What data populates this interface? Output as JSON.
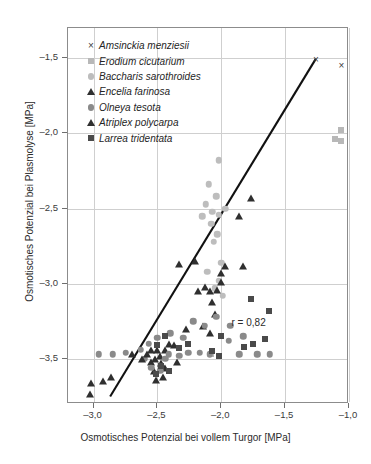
{
  "chart_data": {
    "type": "scatter",
    "title": "",
    "xlabel": "Osmotisches Potenzial bei vollem Turgor [MPa]",
    "ylabel": "Osmotisches Potenzial bei Plasmolyse [MPa]",
    "xlim": [
      -3.2,
      -1.0
    ],
    "ylim": [
      -3.8,
      -1.3
    ],
    "xticks": [
      -3.0,
      -2.5,
      -2.0,
      -1.5,
      -1.0
    ],
    "xticklabels": [
      "–3,0",
      "–2,5",
      "–2,0",
      "–1,5",
      "–1,0"
    ],
    "yticks": [
      -1.5,
      -2.0,
      -2.5,
      -3.0,
      -3.5
    ],
    "yticklabels": [
      "–1,5",
      "–2,0",
      "–2,5",
      "–3,0",
      "–3,5"
    ],
    "grid": true,
    "legend_position": "upper-left-inside",
    "annotation": "r = 0,82",
    "regression_line": {
      "x0": -2.87,
      "y0": -3.75,
      "x1": -1.26,
      "y1": -1.505
    },
    "series": [
      {
        "name": "Amsinckia menziesii",
        "marker": "x",
        "color": "#3d3d3d",
        "points": [
          [
            -1.26,
            -1.51
          ],
          [
            -1.06,
            -1.55
          ]
        ]
      },
      {
        "name": "Erodium cicutarium",
        "marker": "square",
        "color": "#b8b8b8",
        "points": [
          [
            -2.08,
            -3.47
          ],
          [
            -1.06,
            -1.98
          ],
          [
            -1.06,
            -2.05
          ],
          [
            -1.11,
            -2.04
          ]
        ]
      },
      {
        "name": "Baccharis sarothroides",
        "marker": "circle",
        "color": "#bdbdbd",
        "points": [
          [
            -2.02,
            -2.18
          ],
          [
            -2.1,
            -2.34
          ],
          [
            -2.04,
            -2.42
          ],
          [
            -2.12,
            -2.47
          ],
          [
            -2.07,
            -2.52
          ],
          [
            -2.02,
            -2.54
          ],
          [
            -1.97,
            -2.5
          ],
          [
            -2.15,
            -2.55
          ],
          [
            -2.08,
            -2.6
          ],
          [
            -2.03,
            -2.67
          ],
          [
            -2.06,
            -2.72
          ],
          [
            -2.0,
            -2.86
          ],
          [
            -2.11,
            -2.92
          ],
          [
            -2.02,
            -2.98
          ],
          [
            -2.05,
            -3.03
          ],
          [
            -1.99,
            -3.08
          ]
        ]
      },
      {
        "name": "Encelia farinosa",
        "marker": "triangle",
        "color": "#2f2f2f",
        "points": [
          [
            -1.77,
            -2.43
          ],
          [
            -1.86,
            -2.55
          ],
          [
            -1.83,
            -2.88
          ],
          [
            -1.97,
            -2.88
          ],
          [
            -2.0,
            -2.93
          ],
          [
            -2.0,
            -2.99
          ],
          [
            -2.03,
            -3.04
          ],
          [
            -2.09,
            -3.05
          ],
          [
            -2.21,
            -2.85
          ],
          [
            -2.33,
            -2.87
          ],
          [
            -2.13,
            -3.02
          ],
          [
            -2.18,
            -3.05
          ],
          [
            -2.07,
            -3.12
          ],
          [
            -2.05,
            -3.2
          ],
          [
            -2.14,
            -3.28
          ],
          [
            -2.09,
            -3.33
          ],
          [
            -2.28,
            -3.3
          ],
          [
            -2.37,
            -3.41
          ],
          [
            -2.44,
            -3.44
          ],
          [
            -2.48,
            -3.48
          ],
          [
            -2.52,
            -3.5
          ],
          [
            -2.47,
            -3.53
          ],
          [
            -2.44,
            -3.56
          ],
          [
            -2.41,
            -3.4
          ],
          [
            -2.5,
            -3.44
          ],
          [
            -2.55,
            -3.52
          ],
          [
            -2.53,
            -3.58
          ],
          [
            -2.46,
            -3.62
          ],
          [
            -2.51,
            -3.64
          ],
          [
            -2.7,
            -3.47
          ],
          [
            -2.35,
            -3.52
          ]
        ]
      },
      {
        "name": "Olneya tesota",
        "marker": "circle",
        "color": "#8a8a8a",
        "points": [
          [
            -2.04,
            -3.22
          ],
          [
            -1.93,
            -3.28
          ],
          [
            -2.13,
            -3.28
          ],
          [
            -2.22,
            -3.25
          ],
          [
            -1.83,
            -3.35
          ],
          [
            -1.94,
            -3.38
          ],
          [
            -2.3,
            -3.36
          ],
          [
            -2.4,
            -3.33
          ],
          [
            -2.5,
            -3.36
          ],
          [
            -2.57,
            -3.4
          ],
          [
            -2.63,
            -3.44
          ],
          [
            -2.75,
            -3.46
          ],
          [
            -2.85,
            -3.47
          ],
          [
            -2.96,
            -3.47
          ],
          [
            -2.41,
            -3.47
          ],
          [
            -2.33,
            -3.48
          ],
          [
            -2.26,
            -3.46
          ],
          [
            -2.17,
            -3.46
          ],
          [
            -2.09,
            -3.47
          ],
          [
            -1.86,
            -3.47
          ],
          [
            -1.72,
            -3.47
          ],
          [
            -1.62,
            -3.47
          ],
          [
            -2.55,
            -3.56
          ],
          [
            -2.48,
            -3.58
          ],
          [
            -2.6,
            -3.5
          ],
          [
            -2.44,
            -3.5
          ]
        ]
      },
      {
        "name": "Atriplex polycarpa",
        "marker": "triangle",
        "color": "#2f2f2f",
        "points": [
          [
            -3.02,
            -3.66
          ],
          [
            -2.93,
            -3.65
          ],
          [
            -2.86,
            -3.62
          ],
          [
            -3.03,
            -3.73
          ],
          [
            -2.58,
            -3.47
          ],
          [
            -2.55,
            -3.44
          ],
          [
            -2.62,
            -3.5
          ]
        ]
      },
      {
        "name": "Larrea tridentata",
        "marker": "square",
        "color": "#4a4a4a",
        "points": [
          [
            -1.77,
            -3.1
          ],
          [
            -1.63,
            -3.18
          ],
          [
            -1.66,
            -3.37
          ],
          [
            -1.75,
            -3.4
          ],
          [
            -1.82,
            -3.42
          ],
          [
            -2.0,
            -3.35
          ],
          [
            -2.07,
            -3.45
          ],
          [
            -2.02,
            -3.48
          ],
          [
            -2.44,
            -3.35
          ],
          [
            -2.5,
            -3.41
          ],
          [
            -2.47,
            -3.55
          ],
          [
            -2.41,
            -3.58
          ],
          [
            -2.51,
            -3.6
          ],
          [
            -2.33,
            -3.43
          ],
          [
            -2.26,
            -3.4
          ]
        ]
      }
    ]
  },
  "legend": {
    "items": [
      {
        "label": "Amsinckia menziesii",
        "marker": "x",
        "color": "#3d3d3d"
      },
      {
        "label": "Erodium cicutarium",
        "marker": "square",
        "color": "#b8b8b8"
      },
      {
        "label": "Baccharis sarothroides",
        "marker": "circle",
        "color": "#bdbdbd"
      },
      {
        "label": "Encelia farinosa",
        "marker": "triangle",
        "color": "#2f2f2f"
      },
      {
        "label": "Olneya tesota",
        "marker": "circle",
        "color": "#8a8a8a"
      },
      {
        "label": "Atriplex polycarpa",
        "marker": "triangle",
        "color": "#2f2f2f"
      },
      {
        "label": "Larrea tridentata",
        "marker": "square",
        "color": "#4a4a4a"
      }
    ]
  },
  "colors": {
    "frame": "#8c8c8c",
    "grid": "#cfcfcf",
    "regression": "#111111",
    "text": "#2b2b2b"
  }
}
